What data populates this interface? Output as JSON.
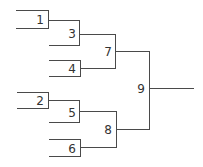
{
  "diagram": {
    "type": "tournament-bracket",
    "line_color": "#4a4a4a",
    "nodes": [
      {
        "id": "1",
        "label": "1",
        "round": 1
      },
      {
        "id": "2",
        "label": "2",
        "round": 1
      },
      {
        "id": "3",
        "label": "3",
        "round": 2,
        "inputs": [
          "1",
          "seed"
        ]
      },
      {
        "id": "4",
        "label": "4",
        "round": 2
      },
      {
        "id": "5",
        "label": "5",
        "round": 2,
        "inputs": [
          "2",
          "seed"
        ]
      },
      {
        "id": "6",
        "label": "6",
        "round": 2
      },
      {
        "id": "7",
        "label": "7",
        "round": 3,
        "inputs": [
          "3",
          "4"
        ]
      },
      {
        "id": "8",
        "label": "8",
        "round": 3,
        "inputs": [
          "5",
          "6"
        ]
      },
      {
        "id": "9",
        "label": "9",
        "round": 4,
        "inputs": [
          "7",
          "8"
        ]
      }
    ],
    "labels": {
      "n1": "1",
      "n2": "2",
      "n3": "3",
      "n4": "4",
      "n5": "5",
      "n6": "6",
      "n7": "7",
      "n8": "8",
      "n9": "9"
    }
  }
}
